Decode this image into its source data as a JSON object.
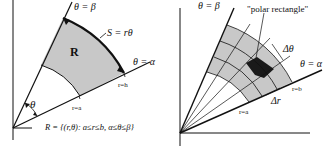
{
  "left_panel": {
    "theta_beta": "θ = β",
    "theta_alpha": "θ = α",
    "arc_label": "S = rθ",
    "region_label": "R",
    "angle_label": "θ",
    "r_a": "r=a",
    "r_b": "r=h",
    "set_definition": "R = {(r,θ): a≤r≤b, α≤θ≤β}"
  },
  "right_panel": {
    "theta_beta": "θ = β",
    "theta_alpha": "θ = α",
    "polar_rectangle": "\"polar rectangle\"",
    "delta_theta": "Δθ",
    "delta_r": "Δr",
    "r_a": "r=a",
    "r_b": "r=b"
  },
  "colors": {
    "region_fill": "#c8c8c8",
    "highlight_cell": "#1a1a1a",
    "lines": "#111111"
  }
}
